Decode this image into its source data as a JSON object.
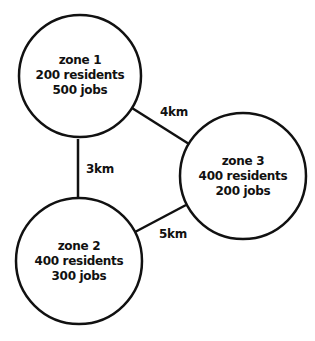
{
  "zones": [
    {
      "name": "zone 1",
      "residents": "200 residents",
      "jobs": "500 jobs"
    },
    {
      "name": "zone 2",
      "residents": "400 residents",
      "jobs": "300 jobs"
    },
    {
      "name": "zone 3",
      "residents": "400 residents",
      "jobs": "200 jobs"
    }
  ],
  "links": [
    {
      "from": "zone 1",
      "to": "zone 2",
      "label": "3km"
    },
    {
      "from": "zone 1",
      "to": "zone 3",
      "label": "4km"
    },
    {
      "from": "zone 2",
      "to": "zone 3",
      "label": "5km"
    }
  ],
  "colors": {
    "stroke": "#111111",
    "background": "#ffffff"
  }
}
